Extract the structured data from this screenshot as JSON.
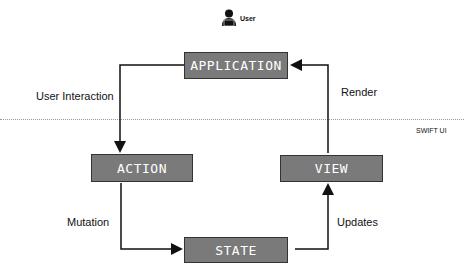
{
  "diagram": {
    "title_section": "SWIFT UI",
    "actor": {
      "label": "User",
      "icon": "user-laptop-icon"
    },
    "nodes": {
      "application": "APPLICATION",
      "action": "ACTION",
      "view": "VIEW",
      "state": "STATE"
    },
    "edges": {
      "user_interaction": "User Interaction",
      "render": "Render",
      "mutation": "Mutation",
      "updates": "Updates"
    },
    "colors": {
      "box_fill": "#7a7a7a",
      "box_border": "#333333",
      "box_text": "#ffffff",
      "arrow": "#111111"
    }
  }
}
